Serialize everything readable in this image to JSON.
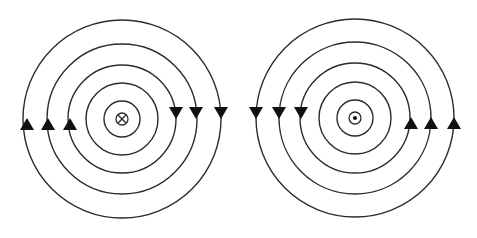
{
  "diagram": {
    "type": "magnetic-field-lines",
    "colors": {
      "line": "#2b2b2b",
      "arrow": "#111111",
      "background": "#ffffff"
    },
    "systems": [
      {
        "id": "left",
        "center": [
          122,
          119
        ],
        "current_symbol": "cross-into-page",
        "ring_radii": [
          18,
          36,
          54,
          75,
          99
        ],
        "symbol_radius": 6,
        "circulation": "clockwise",
        "arrows": [
          {
            "x": 176,
            "y": 113,
            "dir": "down"
          },
          {
            "x": 196,
            "y": 113,
            "dir": "down"
          },
          {
            "x": 221,
            "y": 113,
            "dir": "down"
          },
          {
            "x": 27,
            "y": 124,
            "dir": "up"
          },
          {
            "x": 48,
            "y": 124,
            "dir": "up"
          },
          {
            "x": 70,
            "y": 124,
            "dir": "up"
          }
        ]
      },
      {
        "id": "right",
        "center": [
          355,
          118
        ],
        "current_symbol": "dot-out-of-page",
        "ring_radii": [
          18,
          36,
          55,
          76,
          99
        ],
        "symbol_radius": 6,
        "circulation": "counterclockwise",
        "arrows": [
          {
            "x": 256,
            "y": 113,
            "dir": "down"
          },
          {
            "x": 279,
            "y": 113,
            "dir": "down"
          },
          {
            "x": 301,
            "y": 113,
            "dir": "down"
          },
          {
            "x": 411,
            "y": 123,
            "dir": "up"
          },
          {
            "x": 431,
            "y": 123,
            "dir": "up"
          },
          {
            "x": 454,
            "y": 123,
            "dir": "up"
          }
        ]
      }
    ]
  }
}
